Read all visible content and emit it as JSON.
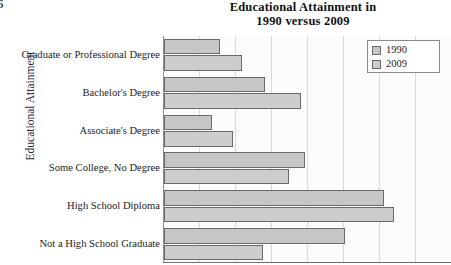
{
  "page_number": "6",
  "chart_data": {
    "type": "bar",
    "orientation": "horizontal",
    "title": "Educational Attainment in 1990 versus 2009",
    "title_line1": "Educational Attainment in",
    "title_line2": "1990 versus 2009",
    "xlabel": "",
    "ylabel": "Educational Attainment",
    "categories": [
      "Graduate or Professional Degree",
      "Bachelor's Degree",
      "Associate's Degree",
      "Some College, No Degree",
      "High School Diploma",
      "Not a High School Graduate"
    ],
    "series": [
      {
        "name": "1990",
        "color": "#c6c6c6",
        "values": [
          7.8,
          14.0,
          6.7,
          19.6,
          30.6,
          25.2
        ]
      },
      {
        "name": "2009",
        "color": "#cdcdcd",
        "values": [
          10.9,
          19.0,
          9.6,
          17.4,
          32.0,
          13.7
        ]
      }
    ],
    "xlim": [
      0,
      40
    ],
    "xticks": [
      0,
      5,
      10,
      15,
      20,
      25,
      30,
      35,
      40
    ],
    "xtick_labels": [],
    "grid": true,
    "grid_axis": "x",
    "legend": {
      "position": "top-right",
      "entries": [
        "1990",
        "2009"
      ]
    }
  }
}
